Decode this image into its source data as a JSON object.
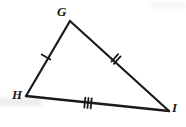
{
  "figure": {
    "kind": "geometry-diagram",
    "shape": "triangle",
    "name": "Triangle GHI",
    "background_color": "#ffffff",
    "stroke_color": "#1a1a1a",
    "stroke_width": 2.2,
    "canvas": {
      "width": 186,
      "height": 127
    }
  },
  "vertices": [
    {
      "id": "G",
      "label": "G",
      "x": 70,
      "y": 21,
      "label_x": 57,
      "label_y": 5
    },
    {
      "id": "H",
      "label": "H",
      "x": 26,
      "y": 96,
      "label_x": 12,
      "label_y": 88
    },
    {
      "id": "I",
      "label": "I",
      "x": 169,
      "y": 111,
      "label_x": 172,
      "label_y": 101
    }
  ],
  "sides": [
    {
      "id": "GH",
      "name": "side-g-h",
      "from": "G",
      "to": "H",
      "tick_count": 1,
      "tick_label": "single-tick",
      "midpoint_x": 46,
      "midpoint_y": 57
    },
    {
      "id": "GI",
      "name": "side-g-i",
      "from": "G",
      "to": "I",
      "tick_count": 2,
      "tick_label": "double-tick",
      "midpoint_x": 116,
      "midpoint_y": 59
    },
    {
      "id": "HI",
      "name": "side-h-i",
      "from": "H",
      "to": "I",
      "tick_count": 3,
      "tick_label": "triple-tick",
      "midpoint_x": 88,
      "midpoint_y": 103
    }
  ]
}
